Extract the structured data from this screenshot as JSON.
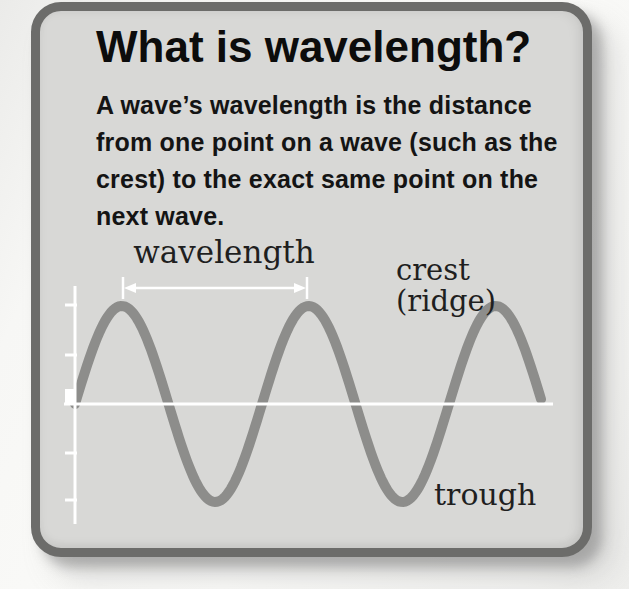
{
  "card": {
    "title": "What is wavelength?",
    "body_lines": [
      "A wave’s wavelength is the distance",
      "from one point on a wave (such as the",
      "crest) to the exact same point on the",
      "next wave."
    ]
  },
  "diagram": {
    "labels": {
      "wavelength": "wavelength",
      "crest": "crest",
      "ridge": "(ridge)",
      "trough": "trough"
    },
    "wave": {
      "type": "sine",
      "start_x": 75,
      "end_x": 542,
      "midline_y": 404,
      "amplitude": 98,
      "wavelength_px": 187,
      "cycles": 2.5,
      "stroke_width": 10,
      "color": "#8d8d8b"
    },
    "axes": {
      "color": "#ffffff",
      "x_axis": {
        "x1": 64,
        "x2": 553,
        "y": 404
      },
      "y_axis": {
        "x": 75,
        "y1": 286,
        "y2": 524
      },
      "y_ticks": [
        305,
        355,
        453,
        500
      ],
      "tick_x1": 65,
      "tick_x2": 77,
      "origin_marker": {
        "x": 65,
        "y": 389,
        "w": 11,
        "h": 14
      }
    },
    "arrow": {
      "color": "#ffffff",
      "y": 288,
      "x1": 123,
      "x2": 307,
      "bar_top": 277,
      "bar_bottom": 299,
      "head_len": 13,
      "head_half_w": 5
    }
  },
  "colors": {
    "page_bg": "#f7f7f5",
    "card_bg": "#d8d8d6",
    "card_border": "#6c6c6a",
    "title_text": "#0c0c0c",
    "body_text": "#141414",
    "label_text": "#1f1f1f",
    "wave": "#8d8d8b",
    "axis": "#ffffff"
  }
}
